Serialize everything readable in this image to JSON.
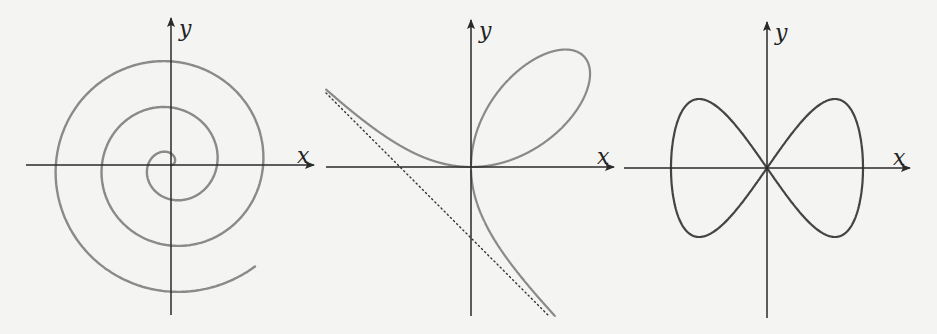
{
  "colors": {
    "background": "#f4f4f2",
    "axis": "#2a2a2a",
    "curve_gray": "#8a8a8a",
    "curve_dark": "#444444",
    "asymptote": "#333333"
  },
  "panels": [
    {
      "id": "spiral",
      "title": "Archimedean spiral",
      "origin": [
        171,
        165
      ],
      "x_axis": {
        "from": 26,
        "to": 314,
        "label": "x",
        "label_pos": [
          297,
          163
        ]
      },
      "y_axis": {
        "from": 315,
        "to": 18,
        "label": "y",
        "label_pos": [
          179,
          36
        ]
      },
      "curve": {
        "type": "archimedean_spiral",
        "k": 7.33,
        "theta_max": 17.97,
        "color_key": "curve_gray",
        "width": 2.4
      }
    },
    {
      "id": "folium",
      "title": "Folium of Descartes",
      "origin": [
        471,
        167
      ],
      "x_axis": {
        "from": 326,
        "to": 614,
        "label": "x",
        "label_pos": [
          597,
          164
        ]
      },
      "y_axis": {
        "from": 316,
        "to": 20,
        "label": "y",
        "label_pos": [
          479,
          38
        ]
      },
      "curve": {
        "type": "folium",
        "ax": 75,
        "ay": 74,
        "color_key": "curve_gray",
        "width": 2.2,
        "x_min": -145,
        "y_max": 149
      },
      "asymptote": {
        "from": [
          326,
          93
        ],
        "to": [
          549,
          316
        ],
        "style": "dotted"
      }
    },
    {
      "id": "lemniscate",
      "title": "Lemniscate of Gerono",
      "origin": [
        767,
        168
      ],
      "x_axis": {
        "from": 624,
        "to": 910,
        "label": "x",
        "label_pos": [
          893,
          165
        ]
      },
      "y_axis": {
        "from": 318,
        "to": 22,
        "label": "y",
        "label_pos": [
          775,
          40
        ]
      },
      "curve": {
        "type": "gerono",
        "a": 96,
        "b": 138,
        "color_key": "curve_dark",
        "width": 2.2
      }
    }
  ]
}
